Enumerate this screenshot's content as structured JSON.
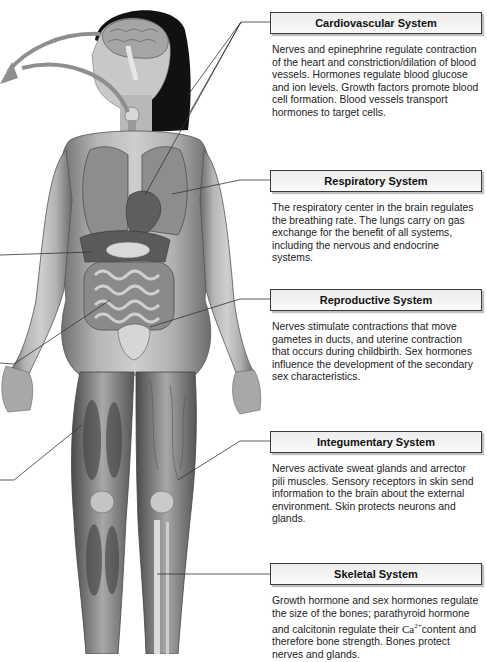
{
  "diagram": {
    "arrows": [
      "brain-to-off-left",
      "thyroid-to-off-left"
    ],
    "colors": {
      "header_border": "#3a3a3a",
      "header_bg": "#f2f2f2",
      "leader_line": "#333333",
      "arrow_fill": "#9a9a9a"
    }
  },
  "panels": [
    {
      "title": "Cardiovascular System",
      "body": "Nerves and epinephrine regulate contraction of the heart and constriction/dilation of blood vessels. Hormones regulate blood glucose and ion levels. Growth factors promote blood cell formation. Blood vessels transport hormones to target cells."
    },
    {
      "title": "Respiratory System",
      "body": "The respiratory center in the brain regulates the breathing rate. The lungs carry on gas exchange for the benefit of all systems, including the nervous and endocrine systems."
    },
    {
      "title": "Reproductive System",
      "body": "Nerves stimulate contractions that move gametes in ducts, and uterine contraction that occurs during childbirth. Sex hormones influence the development of the secondary sex characteristics."
    },
    {
      "title": "Integumentary System",
      "body": "Nerves activate sweat glands and arrector pili muscles. Sensory receptors in skin send information to the brain about the external environment. Skin protects neurons and glands."
    },
    {
      "title": "Skeletal System",
      "body_pre": "Growth hormone and sex hormones regulate the size of the bones; parathyroid hormone and calcitonin regulate their ",
      "ion": "Ca",
      "ion_charge": "2+",
      "body_post": "content and therefore bone strength. Bones protect nerves and glands."
    }
  ]
}
